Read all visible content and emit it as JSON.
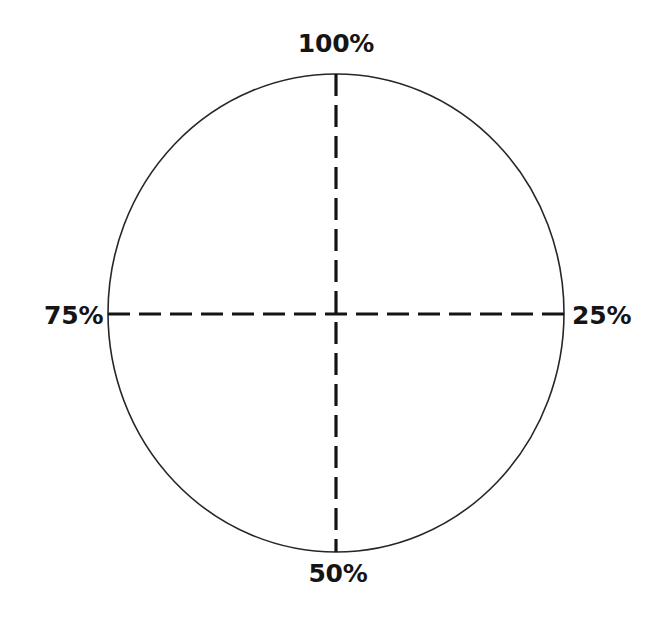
{
  "figure": {
    "title": "",
    "background_color": "#ffffff",
    "width": 647,
    "height": 623
  },
  "labels": {
    "top": "100%",
    "right": "25%",
    "bottom": "50%",
    "left": "75%"
  },
  "chart_data": {
    "type": "pie",
    "title": "",
    "subtitle": "",
    "xlabel": "",
    "ylabel": "",
    "grid": false,
    "legend_position": "none",
    "categories": [
      "Quadrant 1",
      "Quadrant 2",
      "Quadrant 3",
      "Quadrant 4"
    ],
    "values": [
      25,
      25,
      25,
      25
    ],
    "tick_labels": [
      "100%",
      "25%",
      "50%",
      "75%"
    ],
    "tick_angles_deg": [
      90,
      0,
      270,
      180
    ],
    "tick_positions": [
      "top",
      "right",
      "bottom",
      "left"
    ],
    "annotations": [
      {
        "text": "100%",
        "position": "top",
        "value": 100
      },
      {
        "text": "25%",
        "position": "right",
        "value": 25
      },
      {
        "text": "50%",
        "position": "bottom",
        "value": 50
      },
      {
        "text": "75%",
        "position": "left",
        "value": 75
      }
    ],
    "series": [
      {
        "name": "quarters",
        "values": [
          25,
          25,
          25,
          25
        ]
      }
    ]
  },
  "geometry": {
    "center_x": 336,
    "center_y": 313,
    "radius_x": 228,
    "radius_y": 239,
    "outline_color": "#262626",
    "outline_width": 1.6,
    "divider_color": "#141414",
    "divider_width": 3.2,
    "divider_dash": "22 9"
  },
  "colors": {
    "ink": "#151515",
    "outline": "#262626",
    "divider": "#141414",
    "background": "#ffffff"
  }
}
